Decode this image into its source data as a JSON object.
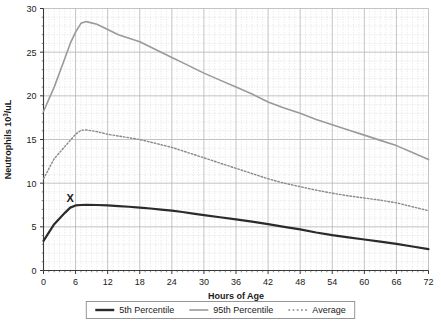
{
  "chart_data": {
    "type": "line",
    "title": "",
    "xlabel": "Hours of Age",
    "ylabel": "Neutrophils 10³/uL",
    "xlim": [
      0,
      72
    ],
    "ylim": [
      0,
      30
    ],
    "xticks": [
      0,
      6,
      12,
      18,
      24,
      30,
      36,
      42,
      48,
      54,
      60,
      66,
      72
    ],
    "yticks": [
      0,
      5,
      10,
      15,
      20,
      25,
      30
    ],
    "xtick_labels": [
      "0",
      "6",
      "12",
      "18",
      "24",
      "30",
      "36",
      "42",
      "48",
      "54",
      "60",
      "66",
      "72"
    ],
    "ytick_labels": [
      "0",
      "5",
      "10",
      "15",
      "20",
      "25",
      "30"
    ],
    "grid": {
      "major_x": true,
      "major_y": true,
      "minor_x_step": 1,
      "minor_y_step": 1,
      "minor_style": "dotted"
    },
    "legend_position": "bottom",
    "x": [
      0,
      2,
      4,
      5,
      6,
      7,
      8,
      10,
      12,
      14,
      16,
      18,
      20,
      22,
      24,
      26,
      28,
      30,
      33,
      36,
      39,
      42,
      45,
      48,
      51,
      54,
      57,
      60,
      63,
      66,
      69,
      72
    ],
    "series": [
      {
        "name": "5th Percentile",
        "color": "#2b2b2b",
        "style": "solid",
        "width": 2.2,
        "values": [
          3.4,
          5.3,
          6.6,
          7.2,
          7.45,
          7.5,
          7.52,
          7.5,
          7.45,
          7.38,
          7.3,
          7.2,
          7.1,
          6.98,
          6.85,
          6.7,
          6.52,
          6.35,
          6.1,
          5.85,
          5.6,
          5.3,
          5.0,
          4.7,
          4.35,
          4.05,
          3.8,
          3.55,
          3.3,
          3.05,
          2.75,
          2.45
        ]
      },
      {
        "name": "95th Percentile",
        "color": "#9a9a9a",
        "style": "solid",
        "width": 1.6,
        "values": [
          18.2,
          21.0,
          24.3,
          26.0,
          27.3,
          28.3,
          28.5,
          28.2,
          27.6,
          27.0,
          26.6,
          26.2,
          25.6,
          25.0,
          24.4,
          23.8,
          23.2,
          22.6,
          21.8,
          21.0,
          20.2,
          19.3,
          18.6,
          18.0,
          17.3,
          16.7,
          16.1,
          15.5,
          14.9,
          14.3,
          13.5,
          12.7
        ]
      },
      {
        "name": "Average",
        "color": "#8a8a8a",
        "style": "dotted",
        "width": 1.4,
        "values": [
          10.5,
          12.8,
          14.2,
          14.9,
          15.6,
          16.05,
          16.1,
          15.9,
          15.6,
          15.4,
          15.2,
          15.0,
          14.7,
          14.4,
          14.1,
          13.7,
          13.3,
          12.9,
          12.3,
          11.7,
          11.1,
          10.5,
          10.0,
          9.6,
          9.2,
          8.85,
          8.55,
          8.3,
          8.05,
          7.75,
          7.3,
          6.85
        ]
      }
    ],
    "annotations": [
      {
        "label": "X",
        "x": 5,
        "y": 7.9,
        "name": "x-marker"
      }
    ]
  },
  "legend": {
    "items": [
      {
        "label": "5th Percentile",
        "swatch": "solid-dark",
        "color": "#2b2b2b"
      },
      {
        "label": "95th Percentile",
        "swatch": "solid-gray",
        "color": "#9a9a9a"
      },
      {
        "label": "Average",
        "swatch": "dotted-gray",
        "color": "#8a8a8a"
      }
    ]
  },
  "colors": {
    "axis": "#3a3a3a",
    "grid_major": "#b5b5b5",
    "grid_minor": "#d8d8d8",
    "background": "#ffffff",
    "text": "#1a1a1a",
    "legend_border": "#8c8c8c"
  }
}
